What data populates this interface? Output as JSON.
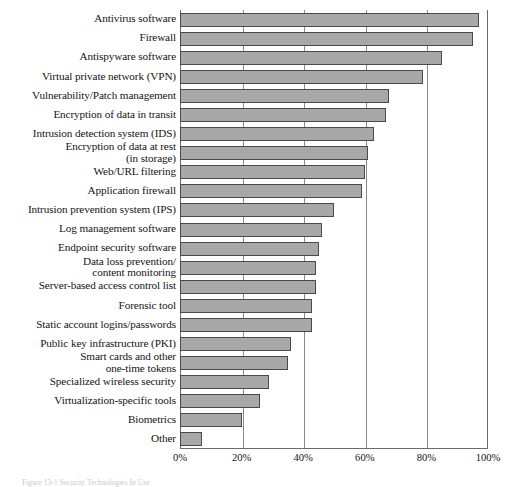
{
  "caption": "Figure 13-1  Security Technologies In Use",
  "chart_data": {
    "type": "bar",
    "orientation": "horizontal",
    "title": "",
    "subtitle": "",
    "xlabel": "",
    "ylabel": "",
    "xlim": [
      0,
      100
    ],
    "xticks": [
      "0%",
      "20%",
      "40%",
      "60%",
      "80%",
      "100%"
    ],
    "xtick_values": [
      0,
      20,
      40,
      60,
      80,
      100
    ],
    "grid": true,
    "grid_axis": "x",
    "legend": null,
    "bar_color": "#a8a8a8",
    "bar_edge_color": "#4a4a4a",
    "categories": [
      "Antivirus software",
      "Firewall",
      "Antispyware software",
      "Virtual private network (VPN)",
      "Vulnerability/Patch management",
      "Encryption of data in transit",
      "Intrusion detection system (IDS)",
      "Encryption of data at rest\n(in storage)",
      "Web/URL filtering",
      "Application firewall",
      "Intrusion prevention system (IPS)",
      "Log management software",
      "Endpoint security software",
      "Data loss prevention/\ncontent monitoring",
      "Server-based access control list",
      "Forensic tool",
      "Static account logins/passwords",
      "Public key infrastructure (PKI)",
      "Smart cards and other\none-time tokens",
      "Specialized wireless security",
      "Virtualization-specific tools",
      "Biometrics",
      "Other"
    ],
    "values": [
      97,
      95,
      85,
      79,
      68,
      67,
      63,
      61,
      60,
      59,
      50,
      46,
      45,
      44,
      44,
      43,
      43,
      36,
      35,
      29,
      26,
      20,
      7
    ]
  }
}
